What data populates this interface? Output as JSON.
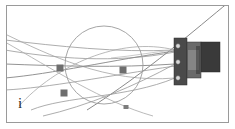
{
  "figure": {
    "panel_label": "i",
    "background_color": "#ffffff",
    "frame_color": "#9a9a9a",
    "wire_color": "#8d8d8d",
    "wire_color_light": "#b4b4b4",
    "sphere_outline_color": "#9b9b9b",
    "marker_color": "#6e6e6e",
    "bracket_dark_color": "#3a3a3a",
    "bracket_mid_color": "#5c5c5c",
    "bracket_light_color": "#8a8a8a"
  },
  "scene": {
    "sphere": {
      "name": "sphere-outline",
      "cx": 97,
      "cy": 59,
      "r": 39
    },
    "wires": [
      {
        "name": "wire-1",
        "d": "M -2 34 C 50 40, 110 47, 168 44"
      },
      {
        "name": "wire-2",
        "d": "M -2 44 C 45 52, 108 58, 168 46"
      },
      {
        "name": "wire-3",
        "d": "M -2 58 C 50 60, 110 62, 168 58"
      },
      {
        "name": "wire-4",
        "d": "M -2 28 C 40 48, 100 78, 168 72"
      },
      {
        "name": "wire-5",
        "d": "M -2 72 C 45 68, 105 54, 168 45"
      },
      {
        "name": "wire-6",
        "d": "M -2 84 C 40 82, 100 70, 168 60"
      },
      {
        "name": "wire-7",
        "d": "M 12 100 C 48 60, 112 30, 168 44"
      },
      {
        "name": "wire-8",
        "d": "M 24 104 C 58 90, 120 92, 168 72"
      },
      {
        "name": "wire-9",
        "d": "M 222 -4 C 190 22, 140 66, 80 104"
      },
      {
        "name": "wire-10",
        "d": "M -2 36 C 44 62, 96 96, 146 110"
      },
      {
        "name": "wire-11",
        "d": "M 36 110 C 80 100, 128 80, 168 58"
      },
      {
        "name": "wire-12",
        "d": "M 104 52 C 126 50, 146 46, 167 44"
      }
    ],
    "markers": [
      {
        "name": "wire-marker-upper-left",
        "cx": 53,
        "cy": 62,
        "w": 7,
        "h": 7,
        "shape": "square"
      },
      {
        "name": "wire-marker-lower-left",
        "cx": 57,
        "cy": 87,
        "w": 7,
        "h": 7,
        "shape": "square"
      },
      {
        "name": "wire-marker-center",
        "cx": 116,
        "cy": 64,
        "w": 7,
        "h": 7,
        "shape": "square"
      },
      {
        "name": "wire-marker-lower-center",
        "cx": 119,
        "cy": 101,
        "w": 5,
        "h": 4,
        "shape": "square"
      }
    ],
    "bracket": {
      "name": "mounting-bracket",
      "plate": {
        "x": 167,
        "y": 32,
        "w": 13,
        "h": 47
      },
      "body": {
        "x": 180,
        "y": 36,
        "w": 14,
        "h": 36
      },
      "block": {
        "x": 194,
        "y": 36,
        "w": 19,
        "h": 30
      },
      "mount_points": [
        {
          "name": "bracket-mount-point-top",
          "cx": 171,
          "cy": 40
        },
        {
          "name": "bracket-mount-point-middle",
          "cx": 171,
          "cy": 56
        },
        {
          "name": "bracket-mount-point-bottom",
          "cx": 171,
          "cy": 72
        }
      ]
    }
  }
}
